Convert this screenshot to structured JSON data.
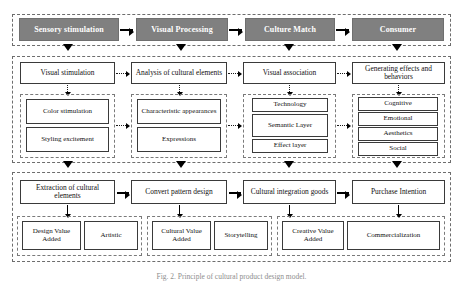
{
  "figure": {
    "caption": "Fig. 2. Principle of cultural product design model.",
    "colors": {
      "header_fill": "#808080",
      "header_text": "#ffffff",
      "box_border": "#3a3a3a",
      "panel_border": "#6d6d6d",
      "arrow": "#000000"
    }
  },
  "bands": {
    "top": {
      "name": "process-stages",
      "stages": [
        {
          "label": "Sensory stimulation"
        },
        {
          "label": "Visual Processing"
        },
        {
          "label": "Culture Match"
        },
        {
          "label": "Consumer"
        }
      ]
    },
    "middle": {
      "name": "analysis-band",
      "columns": [
        {
          "main": "Visual stimulation",
          "children": [
            "Color stimulation",
            "Styling excitement"
          ]
        },
        {
          "main": "Analysis of cultural elements",
          "children": [
            "Characteristic appearances",
            "Expressions"
          ]
        },
        {
          "main": "Visual association",
          "children": [
            "Technology",
            "Semantic Layer",
            "Effect layer"
          ]
        },
        {
          "main": "Generating effects and behaviors",
          "children": [
            "Cognitive",
            "Emotional",
            "Aesthetics",
            "Social"
          ]
        }
      ]
    },
    "bottom": {
      "name": "value-band",
      "columns": [
        {
          "main": "Extraction of cultural elements",
          "children": [
            "Design Value Added",
            "Artistic"
          ]
        },
        {
          "main": "Convert pattern design",
          "children": [
            "Cultural Value Added",
            "Storytelling"
          ]
        },
        {
          "main": "Cultural integration goods",
          "children": [
            "Creative Value Added",
            "Commercialization"
          ]
        },
        {
          "main": "Purchase Intention",
          "children": []
        }
      ]
    }
  }
}
